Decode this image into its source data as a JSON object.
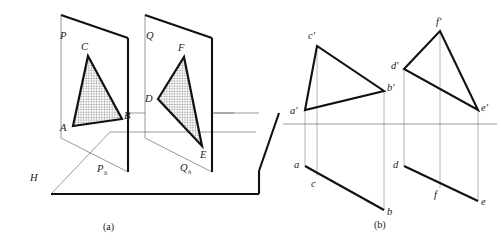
{
  "figure": {
    "captions": [
      {
        "key": "a",
        "text": "(a)",
        "x": 110,
        "y": 228
      },
      {
        "key": "b",
        "text": "(b)",
        "x": 381,
        "y": 226
      }
    ]
  },
  "colors": {
    "ink": "#111111",
    "ink_soft": "#1a1a1a",
    "thin_line": "#555555",
    "hatch": "#3a3a3a",
    "background": "#ffffff"
  },
  "panel_a": {
    "name": "pictorial-view",
    "plane_h": {
      "label": "H",
      "label_x": 30,
      "label_y": 181,
      "outline": "51,194 110,132 256,132 214,113 278,113 315,113 259,171 259,194"
    },
    "plane_p": {
      "label": "P",
      "label_x": 60,
      "label_y": 39,
      "trace_label": "P",
      "trace_sub": "h",
      "trace_label_x": 97,
      "trace_label_y": 172,
      "front_edge": "61,15 128,38",
      "outline": "61,15 128,38 128,172 61,138",
      "inner_outline": "61,15 61,138 128,172 128,38"
    },
    "plane_q": {
      "label": "Q",
      "label_x": 146,
      "label_y": 39,
      "trace_label": "Q",
      "trace_sub": "h",
      "trace_label_x": 186,
      "trace_label_y": 171,
      "outline": "145,15 212,38 212,172 145,138",
      "inner_outline": "145,15 145,138 212,172 212,38"
    },
    "triangle_abc": {
      "name": "triangle-ABC",
      "points": "88,56 122,119 73,126",
      "vertices": [
        {
          "label": "C",
          "x": 85,
          "y": 50
        },
        {
          "label": "B",
          "x": 124,
          "y": 119
        },
        {
          "label": "A",
          "x": 63,
          "y": 128
        }
      ]
    },
    "triangle_def": {
      "name": "triangle-DEF",
      "points": "184,57 202,146 158,99",
      "vertices": [
        {
          "label": "F",
          "x": 181,
          "y": 51
        },
        {
          "label": "E",
          "x": 203,
          "y": 155
        },
        {
          "label": "D",
          "x": 148,
          "y": 101
        }
      ]
    }
  },
  "panel_b": {
    "name": "orthographic-projection",
    "ground_line": {
      "name": "ground-line-XY",
      "x1": 283,
      "y1": 124,
      "x2": 497,
      "y2": 124
    },
    "front_view_abc": {
      "name": "front-view-a-b-c",
      "points": "305,110 317,46 384,91",
      "vertices": [
        {
          "label": "c′",
          "x": 311,
          "y": 39
        },
        {
          "label": "b′",
          "x": 387,
          "y": 90
        },
        {
          "label": "a′",
          "x": 292,
          "y": 113
        }
      ]
    },
    "front_view_def": {
      "name": "front-view-d-e-f",
      "points": "404,69 440,31 478,110",
      "vertices": [
        {
          "label": "f′",
          "x": 438,
          "y": 26
        },
        {
          "label": "d′",
          "x": 394,
          "y": 70
        },
        {
          "label": "e′",
          "x": 482,
          "y": 110
        }
      ]
    },
    "top_view_abc": {
      "name": "top-view-a-b-c",
      "points": "305,166 317,176 384,210",
      "vertices": [
        {
          "label": "a",
          "x": 295,
          "y": 167
        },
        {
          "label": "c",
          "x": 313,
          "y": 186
        },
        {
          "label": "b",
          "x": 387,
          "y": 214
        }
      ]
    },
    "top_view_def": {
      "name": "top-view-d-e-f",
      "points": "404,166 440,188 478,201",
      "vertices": [
        {
          "label": "d",
          "x": 394,
          "y": 166
        },
        {
          "label": "f",
          "x": 436,
          "y": 197
        },
        {
          "label": "e",
          "x": 482,
          "y": 204
        }
      ]
    },
    "projectors": [
      {
        "name": "projector-a",
        "x": 305,
        "y1": 110,
        "y2": 166
      },
      {
        "name": "projector-c",
        "x": 317,
        "y1": 46,
        "y2": 176
      },
      {
        "name": "projector-b",
        "x": 384,
        "y1": 91,
        "y2": 210
      },
      {
        "name": "projector-d",
        "x": 404,
        "y1": 69,
        "y2": 166
      },
      {
        "name": "projector-f",
        "x": 440,
        "y1": 31,
        "y2": 188
      },
      {
        "name": "projector-e",
        "x": 478,
        "y1": 110,
        "y2": 201
      }
    ]
  }
}
